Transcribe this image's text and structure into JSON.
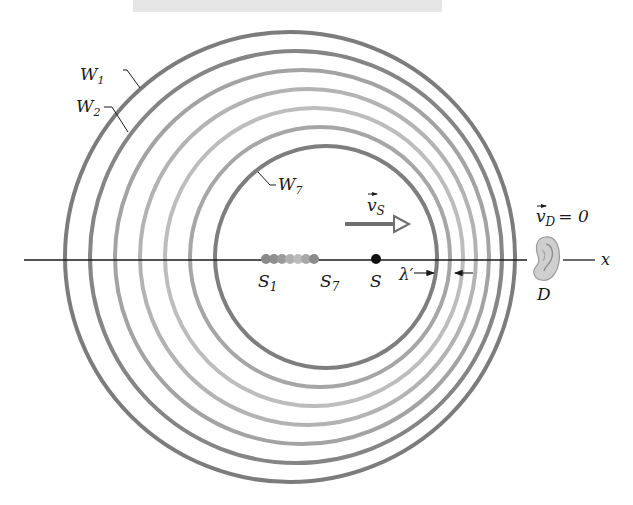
{
  "figure": {
    "colors": {
      "background": "#ffffff",
      "axis": "#1a1a1a",
      "wavefront_dark": "#7a7a7a",
      "wavefront_mid": "#9a9a9a",
      "wavefront_light": "#b8b8b8",
      "source_dot": "#111111",
      "velocity_arrow": "#6e6e6e",
      "ear": "#c9c9c9",
      "top_bar": "#e6e6e6"
    },
    "wavefronts": [
      {
        "id": "W1",
        "label": "W",
        "sub": "1",
        "cx": 290,
        "cy": 257,
        "r": 225,
        "color": "#7c7c7c"
      },
      {
        "id": "W2",
        "label": "W",
        "sub": "2",
        "cx": 296,
        "cy": 257,
        "r": 206,
        "color": "#858585"
      },
      {
        "id": "W3",
        "cx": 302,
        "cy": 257,
        "r": 187,
        "color": "#a3a3a3"
      },
      {
        "id": "W4",
        "cx": 308,
        "cy": 257,
        "r": 168,
        "color": "#b3b3b3"
      },
      {
        "id": "W5",
        "cx": 314,
        "cy": 257,
        "r": 149,
        "color": "#bdbdbd"
      },
      {
        "id": "W6",
        "cx": 320,
        "cy": 257,
        "r": 130,
        "color": "#a6a6a6"
      },
      {
        "id": "W7",
        "label": "W",
        "sub": "7",
        "cx": 326,
        "cy": 257,
        "r": 111,
        "color": "#7e7e7e"
      }
    ],
    "source_positions": [
      {
        "id": "S1",
        "x": 266,
        "color": "#8a8a8a"
      },
      {
        "id": "S2",
        "x": 274,
        "color": "#8f8f8f"
      },
      {
        "id": "S3",
        "x": 282,
        "color": "#9a9a9a"
      },
      {
        "id": "S4",
        "x": 290,
        "color": "#b0b0b0"
      },
      {
        "id": "S5",
        "x": 298,
        "color": "#bcbcbc"
      },
      {
        "id": "S6",
        "x": 306,
        "color": "#a8a8a8"
      },
      {
        "id": "S7",
        "x": 314,
        "color": "#8a8a8a"
      }
    ],
    "labels": {
      "w1": {
        "main": "W",
        "sub": "1"
      },
      "w2": {
        "main": "W",
        "sub": "2"
      },
      "w7": {
        "main": "W",
        "sub": "7"
      },
      "s1": {
        "main": "S",
        "sub": "1"
      },
      "s7": {
        "main": "S",
        "sub": "7"
      },
      "s": "S",
      "vs": {
        "main": "v",
        "sub": "S"
      },
      "vd": {
        "main": "v",
        "sub": "D",
        "eq": "= 0"
      },
      "lambda": "λ′",
      "detector": "D",
      "axis": "x"
    }
  }
}
